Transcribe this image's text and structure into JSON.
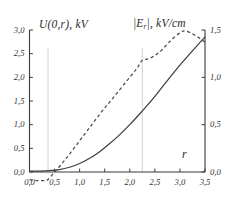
{
  "figure": {
    "background": "#ffffff",
    "ink_color": "#3a3a38",
    "gridline_color": "#c8c8c4"
  },
  "axes": {
    "left": {
      "title": "U(0,r), kV",
      "min": 0.0,
      "max": 3.0,
      "ticks": [
        0.0,
        0.5,
        1.0,
        1.5,
        2.0,
        2.5,
        3.0
      ],
      "tick_labels": [
        "0,0",
        "0,5",
        "1,0",
        "1,5",
        "2,0",
        "2,5",
        "3,0"
      ]
    },
    "right": {
      "title_main": "|E",
      "title_sub": "r",
      "title_tail": "|, kV/cm",
      "title": "|E_r|, kV/cm",
      "min": 0.0,
      "max": 1.5,
      "ticks": [
        0.0,
        0.5,
        1.0,
        1.5
      ],
      "tick_labels": [
        "0,0",
        "0,5",
        "1,0",
        "1,5"
      ]
    },
    "bottom": {
      "title": "r",
      "min": 0.0,
      "max": 3.5,
      "ticks": [
        0.0,
        0.5,
        1.0,
        1.5,
        2.0,
        2.5,
        3.0,
        3.5
      ],
      "tick_labels": [
        "0,0",
        "0,5",
        "1,0",
        "1,5",
        "2,0",
        "2,5",
        "3,0",
        "3,5"
      ]
    }
  },
  "chart_data": {
    "type": "line",
    "title": "",
    "xlabel": "r",
    "ylabel": "U(0,r), kV",
    "y2label": "|E_r|, kV/cm",
    "xlim": [
      0.0,
      3.5
    ],
    "ylim": [
      0.0,
      3.0
    ],
    "y2lim": [
      0.0,
      1.5
    ],
    "grid": false,
    "legend": "none",
    "vertical_markers": [
      0.37,
      2.25
    ],
    "series": [
      {
        "name": "U(0,r), kV",
        "axis": "left",
        "style": "solid",
        "x": [
          0.0,
          0.2,
          0.4,
          0.6,
          0.8,
          1.0,
          1.2,
          1.4,
          1.6,
          1.8,
          2.0,
          2.2,
          2.4,
          2.6,
          2.8,
          3.0,
          3.2,
          3.4,
          3.5
        ],
        "values": [
          0.02,
          0.02,
          0.03,
          0.05,
          0.1,
          0.18,
          0.29,
          0.43,
          0.6,
          0.79,
          1.0,
          1.23,
          1.47,
          1.73,
          2.0,
          2.26,
          2.5,
          2.74,
          2.85
        ]
      },
      {
        "name": "|E_r|, kV/cm",
        "axis": "right",
        "style": "dashed",
        "x": [
          0.0,
          0.15,
          0.3,
          0.37,
          0.5,
          0.65,
          0.8,
          1.0,
          1.2,
          1.4,
          1.6,
          1.8,
          2.0,
          2.15,
          2.25,
          2.4,
          2.6,
          2.8,
          3.0,
          3.1,
          3.25,
          3.4,
          3.5
        ],
        "values": [
          -0.08,
          -0.09,
          -0.09,
          -0.08,
          0.0,
          0.09,
          0.19,
          0.33,
          0.47,
          0.61,
          0.74,
          0.87,
          1.0,
          1.1,
          1.18,
          1.2,
          1.27,
          1.38,
          1.47,
          1.49,
          1.46,
          1.41,
          1.37
        ]
      }
    ]
  }
}
